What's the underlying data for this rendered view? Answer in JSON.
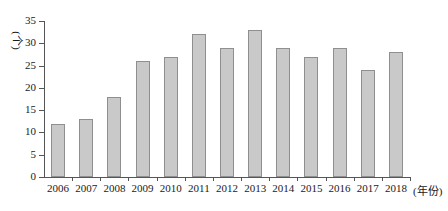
{
  "chart_data": {
    "type": "bar",
    "title": "",
    "xlabel": "(年份)",
    "ylabel": "(个)",
    "categories": [
      "2006",
      "2007",
      "2008",
      "2009",
      "2010",
      "2011",
      "2012",
      "2013",
      "2014",
      "2015",
      "2016",
      "2017",
      "2018"
    ],
    "values": [
      12,
      13,
      18,
      26,
      27,
      32,
      29,
      33,
      29,
      27,
      29,
      24,
      28
    ],
    "ylim": [
      0,
      35
    ],
    "yticks": [
      0,
      5,
      10,
      15,
      20,
      25,
      30,
      35
    ],
    "ytick_labels": [
      "0",
      "5",
      "10",
      "15",
      "20",
      "25",
      "30",
      "35"
    ],
    "grid": false,
    "legend": null,
    "bar_color": "#c9c9c9",
    "bar_border_color": "#8f8f8f",
    "axis_color": "#555555",
    "text_color": "#1a1a1a",
    "background": "#ffffff"
  }
}
